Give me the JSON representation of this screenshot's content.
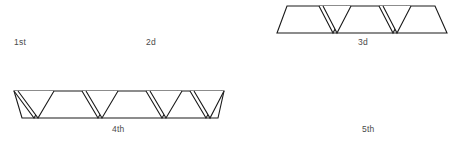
{
  "figure": {
    "background_color": "#ffffff",
    "stroke_color": "#1a1a1a",
    "label_color": "#4a4a4a",
    "ordinals": [
      {
        "id": "1st",
        "label": "1st",
        "has_shape": false
      },
      {
        "id": "2d",
        "label": "2d",
        "has_shape": false
      },
      {
        "id": "3d",
        "label": "3d",
        "has_shape": true
      },
      {
        "id": "4th",
        "label": "4th",
        "has_shape": true
      },
      {
        "id": "5th",
        "label": "5th",
        "has_shape": false
      }
    ],
    "shapes": [
      {
        "id": "triangle-strip-3d",
        "name": "triangle-strip-upper",
        "description": "horizontal strip of alternating triangles, left end is a trapezoid with slanted left edge",
        "triangle_count": 5,
        "starts_with": "up",
        "ends_with": "up"
      },
      {
        "id": "triangle-strip-4th",
        "name": "triangle-strip-lower",
        "description": "horizontal strip of alternating triangles, begins and ends with downward-pointing triangles",
        "triangle_count": 7,
        "starts_with": "down",
        "ends_with": "down"
      }
    ]
  }
}
